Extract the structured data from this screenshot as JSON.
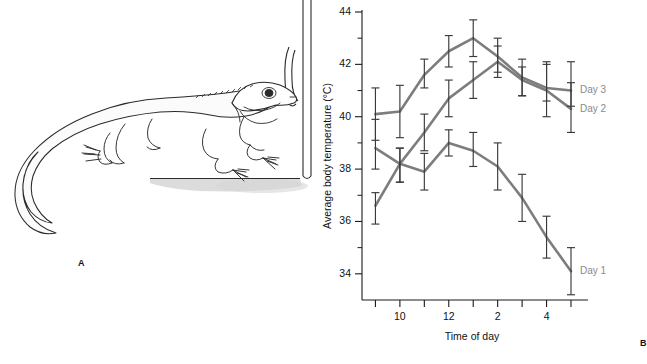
{
  "figure": {
    "panel_a_label": "A",
    "panel_b_label": "B",
    "illustration": {
      "name": "lizard-basking-beside-plant",
      "subject": "lizard",
      "accessory": "cactus-stem",
      "ground_shadow": true
    }
  },
  "chart_data": {
    "type": "line",
    "title": "",
    "xlabel": "Time of day",
    "ylabel": "Average body temperature (°C)",
    "ylim": [
      33,
      44
    ],
    "yticks_major": [
      34,
      36,
      38,
      40,
      42,
      44
    ],
    "yticks_minor": [
      35,
      37,
      39,
      41,
      43
    ],
    "grid": false,
    "legend_position": "right-of-last-point",
    "x": [
      9,
      10,
      11,
      12,
      13,
      14,
      15,
      16,
      17
    ],
    "xtick_labels": [
      "",
      "10",
      "",
      "12",
      "",
      "2",
      "",
      "4",
      ""
    ],
    "xticks_all": [
      "9",
      "10",
      "11",
      "12",
      "1",
      "2",
      "3",
      "4",
      "5"
    ],
    "error_type": "error bars",
    "line_color": "#7d7d7d",
    "errorbar_color": "#3a3a3a",
    "series": [
      {
        "name": "Day 3",
        "label": "Day 3",
        "values": [
          40.1,
          40.2,
          41.6,
          42.5,
          43.0,
          42.3,
          41.5,
          41.1,
          41.0
        ],
        "err_low": [
          39.1,
          39.2,
          41.1,
          41.9,
          42.3,
          41.7,
          40.8,
          40.6,
          40.4
        ],
        "err_high": [
          41.1,
          41.2,
          42.2,
          43.1,
          43.7,
          43.0,
          42.2,
          42.1,
          42.1
        ]
      },
      {
        "name": "Day 2",
        "label": "Day 2",
        "values": [
          38.8,
          38.2,
          39.4,
          40.7,
          41.4,
          42.1,
          41.4,
          41.0,
          40.3
        ],
        "err_low": [
          38.0,
          37.5,
          38.7,
          40.0,
          40.7,
          41.5,
          40.8,
          40.0,
          39.4
        ],
        "err_high": [
          39.9,
          38.8,
          40.1,
          41.4,
          42.1,
          42.7,
          41.9,
          42.0,
          41.3
        ]
      },
      {
        "name": "Day 1",
        "label": "Day 1",
        "values": [
          36.6,
          38.2,
          37.9,
          39.0,
          38.7,
          38.1,
          36.9,
          35.4,
          34.1
        ],
        "err_low": [
          35.9,
          37.5,
          37.2,
          38.5,
          38.1,
          37.2,
          36.0,
          34.6,
          33.2
        ],
        "err_high": [
          37.1,
          38.8,
          38.6,
          39.5,
          39.4,
          39.0,
          37.8,
          36.2,
          35.0
        ]
      }
    ]
  }
}
